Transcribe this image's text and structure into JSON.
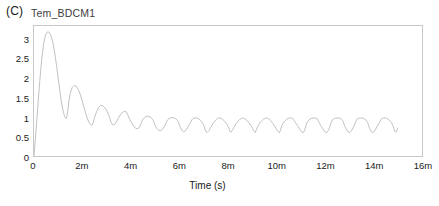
{
  "panel": {
    "label": "(C)",
    "series_title": "Tem_BDCM1"
  },
  "chart_data": {
    "type": "line",
    "title": "Tem_BDCM1",
    "panel_label": "(C)",
    "xlabel": "Time (s)",
    "ylabel": "",
    "xlim": [
      0,
      0.016
    ],
    "ylim": [
      0,
      3.35
    ],
    "grid": false,
    "legend": null,
    "line_color": "#b9b9b9",
    "frame_color": "#c8c8c8",
    "x_tick_labels": [
      "0",
      "2m",
      "4m",
      "6m",
      "8m",
      "10m",
      "12m",
      "14m",
      "16m"
    ],
    "x_tick_values": [
      0,
      0.002,
      0.004,
      0.006,
      0.008,
      0.01,
      0.012,
      0.014,
      0.016
    ],
    "y_tick_labels": [
      "0",
      "0.5",
      "1",
      "1.5",
      "2",
      "2.5",
      "3"
    ],
    "y_tick_values": [
      0,
      0.5,
      1,
      1.5,
      2,
      2.5,
      3
    ],
    "series": [
      {
        "name": "Tem_BDCM1",
        "x": [
          0.0,
          8e-05,
          0.00016,
          0.00024,
          0.00032,
          0.0004,
          0.00048,
          0.00056,
          0.00062,
          0.0007,
          0.00078,
          0.00086,
          0.00094,
          0.00102,
          0.0011,
          0.00118,
          0.00126,
          0.00132,
          0.00136,
          0.0014,
          0.00144,
          0.0015,
          0.00158,
          0.00166,
          0.00174,
          0.00182,
          0.0019,
          0.00198,
          0.00206,
          0.00214,
          0.00222,
          0.0023,
          0.00236,
          0.0024,
          0.00244,
          0.0025,
          0.00258,
          0.00266,
          0.00274,
          0.00282,
          0.0029,
          0.00298,
          0.00306,
          0.00312,
          0.00316,
          0.0032,
          0.00326,
          0.00334,
          0.00342,
          0.0035,
          0.00358,
          0.00366,
          0.00374,
          0.0038,
          0.00384,
          0.00388,
          0.00394,
          0.00402,
          0.0041,
          0.00418,
          0.00426,
          0.00434,
          0.0044,
          0.00444,
          0.00448,
          0.00454,
          0.00462,
          0.0047,
          0.00478,
          0.00486,
          0.00492,
          0.00496,
          0.005,
          0.00506,
          0.00514,
          0.00522,
          0.0053,
          0.00538,
          0.00544,
          0.00548,
          0.00552,
          0.00558,
          0.00566,
          0.00574,
          0.00582,
          0.0059,
          0.00596,
          0.006,
          0.00604,
          0.0061,
          0.00618,
          0.00626,
          0.00634,
          0.00642,
          0.00648,
          0.00652,
          0.00656,
          0.00662,
          0.0067,
          0.00678,
          0.00686,
          0.00694,
          0.007,
          0.00704,
          0.00708,
          0.00714,
          0.00722,
          0.0073,
          0.00738,
          0.00746,
          0.00752,
          0.00756,
          0.0076,
          0.00766,
          0.00774,
          0.00782,
          0.0079,
          0.00798,
          0.00804,
          0.00808,
          0.00812,
          0.00818,
          0.00826,
          0.00834,
          0.00842,
          0.0085,
          0.00856,
          0.0086,
          0.00864,
          0.0087,
          0.00878,
          0.00886,
          0.00894,
          0.00902,
          0.00908,
          0.00912,
          0.00916,
          0.00922,
          0.0093,
          0.00938,
          0.00946,
          0.00954,
          0.0096,
          0.00964,
          0.00968,
          0.00974,
          0.00982,
          0.0099,
          0.00998,
          0.01006,
          0.01012,
          0.01016,
          0.0102,
          0.01026,
          0.01034,
          0.01042,
          0.0105,
          0.01058,
          0.01064,
          0.01068,
          0.01072,
          0.01078,
          0.01086,
          0.01094,
          0.01102,
          0.0111,
          0.01116,
          0.0112,
          0.01124,
          0.0113,
          0.01138,
          0.01146,
          0.01154,
          0.01162,
          0.01168,
          0.01172,
          0.01176,
          0.01182,
          0.0119,
          0.01198,
          0.01206,
          0.01214,
          0.0122,
          0.01224,
          0.01228,
          0.01234,
          0.01242,
          0.0125,
          0.01258,
          0.01266,
          0.01272,
          0.01276,
          0.0128,
          0.01286,
          0.01294,
          0.01302,
          0.0131,
          0.01318,
          0.01324,
          0.01328,
          0.01332,
          0.01338,
          0.01346,
          0.01354,
          0.01362,
          0.0137,
          0.01376,
          0.0138,
          0.01384,
          0.0139,
          0.01398,
          0.01406,
          0.01414,
          0.01422,
          0.01428,
          0.01432,
          0.01436,
          0.01442,
          0.0145,
          0.01458,
          0.01466,
          0.01474,
          0.0148,
          0.01484,
          0.01488,
          0.01494,
          0.015
        ],
        "y": [
          0.0,
          0.62,
          1.3,
          1.95,
          2.5,
          2.9,
          3.12,
          3.2,
          3.19,
          3.1,
          2.92,
          2.64,
          2.28,
          1.9,
          1.52,
          1.22,
          1.02,
          0.96,
          1.02,
          1.2,
          1.42,
          1.63,
          1.77,
          1.82,
          1.8,
          1.72,
          1.6,
          1.44,
          1.26,
          1.08,
          0.93,
          0.83,
          0.79,
          0.8,
          0.86,
          1.0,
          1.14,
          1.25,
          1.3,
          1.3,
          1.26,
          1.19,
          1.09,
          0.99,
          0.9,
          0.84,
          0.8,
          0.82,
          0.9,
          1.0,
          1.08,
          1.13,
          1.15,
          1.14,
          1.1,
          1.04,
          0.95,
          0.86,
          0.78,
          0.72,
          0.7,
          0.73,
          0.81,
          0.88,
          0.93,
          0.98,
          1.02,
          1.03,
          1.01,
          0.97,
          0.92,
          0.85,
          0.78,
          0.71,
          0.66,
          0.65,
          0.69,
          0.76,
          0.84,
          0.9,
          0.94,
          0.97,
          0.99,
          0.99,
          0.97,
          0.93,
          0.87,
          0.8,
          0.73,
          0.66,
          0.62,
          0.66,
          0.74,
          0.83,
          0.89,
          0.94,
          0.97,
          0.98,
          0.98,
          0.96,
          0.92,
          0.86,
          0.79,
          0.72,
          0.64,
          0.61,
          0.66,
          0.75,
          0.84,
          0.9,
          0.94,
          0.97,
          0.98,
          0.98,
          0.96,
          0.92,
          0.86,
          0.79,
          0.71,
          0.63,
          0.61,
          0.66,
          0.75,
          0.84,
          0.9,
          0.95,
          0.97,
          0.98,
          0.98,
          0.96,
          0.92,
          0.86,
          0.79,
          0.71,
          0.63,
          0.6,
          0.66,
          0.75,
          0.84,
          0.9,
          0.95,
          0.97,
          0.98,
          0.98,
          0.96,
          0.92,
          0.86,
          0.79,
          0.71,
          0.63,
          0.6,
          0.66,
          0.75,
          0.84,
          0.9,
          0.95,
          0.97,
          0.98,
          0.98,
          0.96,
          0.92,
          0.86,
          0.79,
          0.71,
          0.63,
          0.6,
          0.66,
          0.75,
          0.84,
          0.9,
          0.95,
          0.97,
          0.98,
          0.98,
          0.96,
          0.92,
          0.86,
          0.79,
          0.71,
          0.63,
          0.6,
          0.66,
          0.75,
          0.84,
          0.9,
          0.95,
          0.97,
          0.98,
          0.98,
          0.96,
          0.92,
          0.86,
          0.79,
          0.71,
          0.63,
          0.6,
          0.66,
          0.75,
          0.84,
          0.9,
          0.95,
          0.97,
          0.98,
          0.98,
          0.96,
          0.92,
          0.86,
          0.79,
          0.71,
          0.63,
          0.6,
          0.66,
          0.75,
          0.84,
          0.9,
          0.95,
          0.97,
          0.98,
          0.98,
          0.96,
          0.92,
          0.86,
          0.79,
          0.71,
          0.63,
          0.62,
          0.72
        ]
      }
    ]
  }
}
